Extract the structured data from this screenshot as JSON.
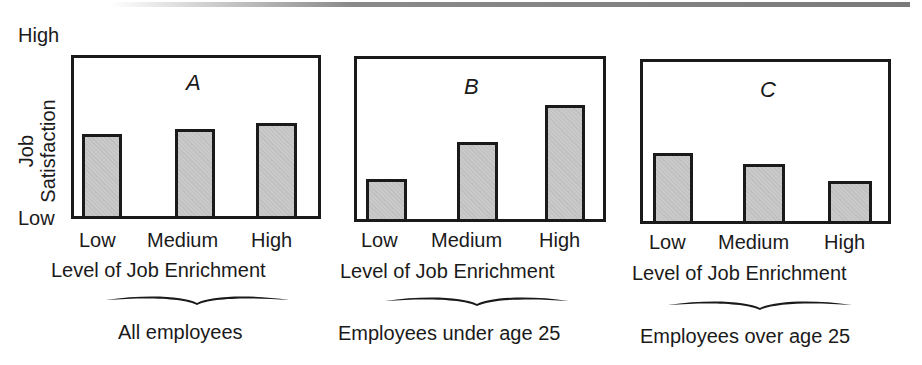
{
  "chart_data": [
    {
      "type": "bar",
      "panel": "A",
      "title": "A",
      "group_label": "All employees",
      "xlabel": "Level of Job Enrichment",
      "ylabel": "Job Satisfaction",
      "categories": [
        "Low",
        "Medium",
        "High"
      ],
      "values": [
        5.2,
        5.5,
        5.9
      ],
      "y_tick_labels": [
        "Low",
        "High"
      ],
      "ylim": [
        0,
        10
      ],
      "grid": false
    },
    {
      "type": "bar",
      "panel": "B",
      "title": "B",
      "group_label": "Employees under age 25",
      "xlabel": "Level of Job Enrichment",
      "ylabel": "Job Satisfaction",
      "categories": [
        "Low",
        "Medium",
        "High"
      ],
      "values": [
        2.5,
        4.8,
        7.1
      ],
      "y_tick_labels": [
        "Low",
        "High"
      ],
      "ylim": [
        0,
        10
      ],
      "grid": false
    },
    {
      "type": "bar",
      "panel": "C",
      "title": "C",
      "group_label": "Employees over age 25",
      "xlabel": "Level of Job Enrichment",
      "ylabel": "Job Satisfaction",
      "categories": [
        "Low",
        "Medium",
        "High"
      ],
      "values": [
        4.3,
        3.6,
        2.5
      ],
      "y_tick_labels": [
        "Low",
        "High"
      ],
      "ylim": [
        0,
        10
      ],
      "grid": false
    }
  ],
  "yaxis": {
    "high": "High",
    "low": "Low",
    "title": "Job Satisfaction"
  },
  "colors": {
    "bar_fill": "#c9c9c9",
    "border": "#1a1a1a",
    "top_rule": "#7a7a7a"
  }
}
